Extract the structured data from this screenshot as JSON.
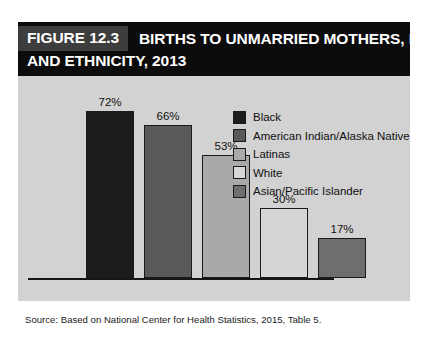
{
  "figure": {
    "number_label": "FIGURE 12.3",
    "title_line_1": "BIRTHS TO UNMARRIED MOTHERS, BY RACE",
    "title_line_2": "AND ETHNICITY, 2013",
    "source": "Source: Based on National Center for Health Statistics, 2015, Table 5."
  },
  "colors": {
    "title_bar_bg": "#0c0c0c",
    "fig_num_bg": "#3d3d3d",
    "panel_bg": "#d2d2d2",
    "axis": "#161616",
    "bar_outline": "#1a1a1a",
    "page_bg": "#ffffff"
  },
  "chart_data": {
    "type": "bar",
    "title": "FIGURE 12.3 BIRTHS TO UNMARRIED MOTHERS, BY RACE AND ETHNICITY, 2013",
    "xlabel": "",
    "ylabel": "",
    "ylim": [
      0,
      80
    ],
    "grid": false,
    "legend_position": "top-right",
    "categories": [
      "Black",
      "American Indian/Alaska Native",
      "Latinas",
      "White",
      "Asian/Pacific Islander"
    ],
    "values": [
      72,
      66,
      53,
      30,
      17
    ],
    "data_labels": [
      "72%",
      "66%",
      "53%",
      "30%",
      "17%"
    ],
    "colors": [
      "#1c1c1c",
      "#595959",
      "#a9a9a9",
      "#d6d6d6",
      "#6e6e6e"
    ],
    "source": "Source: Based on National Center for Health Statistics, 2015, Table 5."
  }
}
